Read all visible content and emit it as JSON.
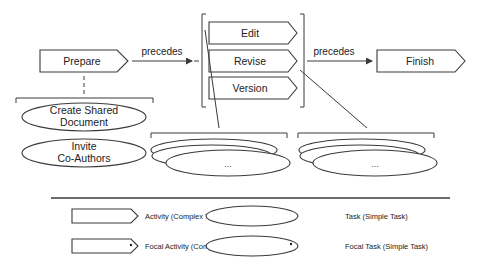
{
  "diagram": {
    "activities": {
      "prepare": "Prepare",
      "edit": "Edit",
      "revise": "Revise",
      "version": "Version",
      "finish": "Finish"
    },
    "edges": {
      "prepare_to_group": "precedes",
      "group_to_finish": "precedes"
    },
    "tasks": {
      "create_shared_doc_line1": "Create Shared",
      "create_shared_doc_line2": "Document",
      "invite_line1": "Invite",
      "invite_line2": "Co-Authors",
      "edit_subtasks": "...",
      "revise_subtasks": "..."
    }
  },
  "legend": {
    "activity": "Activity (Complex Task)",
    "task": "Task (Simple Task)",
    "focal_activity": "Focal Activity (Complex Task)",
    "focal_task": "Focal Task (Simple Task)"
  }
}
